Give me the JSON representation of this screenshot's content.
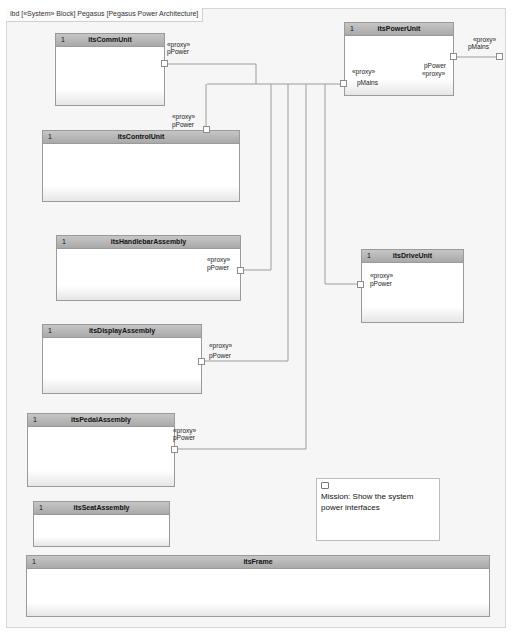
{
  "diagram": {
    "frame_label": "ibd [«System» Block] Pegasus [Pegasus Power Architecture]"
  },
  "blocks": [
    {
      "id": "comm",
      "multiplicity": "1",
      "name": "itsCommUnit"
    },
    {
      "id": "power",
      "multiplicity": "1",
      "name": "itsPowerUnit"
    },
    {
      "id": "control",
      "multiplicity": "1",
      "name": "itsControlUnit"
    },
    {
      "id": "handlebar",
      "multiplicity": "1",
      "name": "itsHandlebarAssembly"
    },
    {
      "id": "drive",
      "multiplicity": "1",
      "name": "itsDriveUnit"
    },
    {
      "id": "display",
      "multiplicity": "1",
      "name": "itsDisplayAssembly"
    },
    {
      "id": "pedal",
      "multiplicity": "1",
      "name": "itsPedalAssembly"
    },
    {
      "id": "seat",
      "multiplicity": "1",
      "name": "itsSeatAssembly"
    },
    {
      "id": "frame",
      "multiplicity": "1",
      "name": "itsFrame"
    }
  ],
  "ports": {
    "stereotype": "«proxy»",
    "comm_pPower": "pPower",
    "power_pMains_inner": "pMains",
    "power_pPower": "pPower",
    "system_pMains": "pMains",
    "control_pPower": "pPower",
    "handlebar_pPower": "pPower",
    "drive_pPower": "pPower",
    "display_pPower": "pPower",
    "pedal_pPower": "pPower"
  },
  "note": {
    "text": "Mission: Show the system power interfaces"
  }
}
